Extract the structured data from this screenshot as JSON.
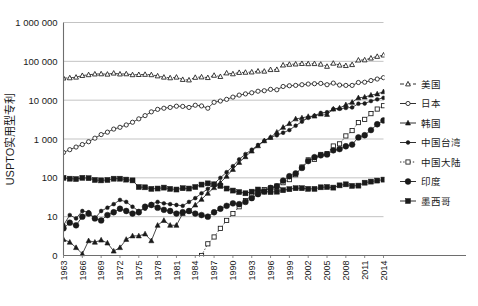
{
  "chart_data": {
    "type": "line",
    "title": "",
    "xlabel": "",
    "ylabel": "USPTO实用型专利",
    "yscale": "log",
    "ylim": [
      1,
      1000000
    ],
    "ytick_labels": [
      "1 000 000",
      "100 000",
      "10 000",
      "1 000",
      "100",
      "10",
      "0"
    ],
    "ytick_values": [
      1000000,
      100000,
      10000,
      1000,
      100,
      10,
      1
    ],
    "grid": true,
    "legend_position": "right",
    "x": [
      1963,
      1964,
      1965,
      1966,
      1967,
      1968,
      1969,
      1970,
      1971,
      1972,
      1973,
      1974,
      1975,
      1976,
      1977,
      1978,
      1979,
      1980,
      1981,
      1982,
      1983,
      1984,
      1985,
      1986,
      1987,
      1988,
      1989,
      1990,
      1991,
      1992,
      1993,
      1994,
      1995,
      1996,
      1997,
      1998,
      1999,
      2000,
      2001,
      2002,
      2003,
      2004,
      2005,
      2006,
      2007,
      2008,
      2009,
      2010,
      2011,
      2012,
      2013,
      2014
    ],
    "xtick_labels": [
      "1963",
      "1966",
      "1969",
      "1972",
      "1975",
      "1978",
      "1981",
      "1984",
      "1987",
      "1990",
      "1993",
      "1996",
      "1999",
      "2002",
      "2005",
      "2008",
      "2011",
      "2014"
    ],
    "series": [
      {
        "name": "美国",
        "marker": "open-triangle",
        "line": "dashed",
        "values": [
          37000,
          37500,
          39000,
          43000,
          45000,
          47000,
          47500,
          46500,
          49500,
          47000,
          47500,
          45000,
          45500,
          46000,
          45000,
          42000,
          39000,
          37500,
          39000,
          34000,
          33000,
          38500,
          39500,
          38000,
          43500,
          40500,
          50000,
          47500,
          51500,
          52000,
          53000,
          56000,
          55500,
          61000,
          61500,
          80000,
          83500,
          85000,
          87500,
          86500,
          87000,
          84000,
          74000,
          89000,
          79500,
          77500,
          82000,
          107500,
          108500,
          121000,
          133500,
          144500
        ]
      },
      {
        "name": "日本",
        "marker": "open-circle",
        "line": "solid",
        "values": [
          450,
          530,
          620,
          720,
          850,
          1050,
          1300,
          1500,
          1800,
          2000,
          2300,
          2700,
          3300,
          4000,
          5000,
          5800,
          6200,
          6500,
          7000,
          6900,
          6500,
          7400,
          7100,
          6200,
          8800,
          9500,
          10500,
          12000,
          13500,
          14500,
          15500,
          17000,
          17500,
          19000,
          18500,
          22500,
          23500,
          24000,
          25000,
          26000,
          26500,
          27000,
          25000,
          27500,
          24500,
          24000,
          24000,
          28500,
          29000,
          32000,
          35000,
          38000
        ]
      },
      {
        "name": "韩国",
        "marker": "filled-triangle",
        "line": "solid",
        "values": [
          2.6,
          2.2,
          1.6,
          1.1,
          2.4,
          2.2,
          2.5,
          2.1,
          1.3,
          1.6,
          2.6,
          3.2,
          3.2,
          3.6,
          2.4,
          6,
          8,
          6,
          6,
          12,
          14,
          20,
          28,
          40,
          56,
          75,
          110,
          165,
          250,
          350,
          490,
          670,
          900,
          1100,
          1500,
          2000,
          2500,
          3300,
          3500,
          3800,
          3900,
          4400,
          4300,
          5900,
          6300,
          7600,
          8800,
          11500,
          12000,
          13500,
          14500,
          16500
        ]
      },
      {
        "name": "中国台湾",
        "marker": "filled-circle-small",
        "line": "solid",
        "values": [
          6,
          11,
          9,
          14,
          13,
          9,
          14,
          17,
          21,
          27,
          24,
          18,
          14,
          16,
          21,
          24,
          22,
          21,
          20,
          19,
          24,
          30,
          40,
          52,
          70,
          100,
          140,
          200,
          300,
          410,
          530,
          700,
          900,
          1100,
          1250,
          1450,
          1700,
          2200,
          2800,
          3500,
          4000,
          4700,
          4900,
          5900,
          6000,
          6300,
          6500,
          8100,
          8200,
          9500,
          10500,
          11500
        ]
      },
      {
        "name": "中国大陆",
        "marker": "open-square",
        "line": "dotted",
        "values": [
          null,
          null,
          null,
          null,
          null,
          null,
          null,
          null,
          null,
          null,
          null,
          null,
          null,
          null,
          null,
          null,
          null,
          null,
          null,
          null,
          null,
          null,
          1,
          2,
          3,
          5,
          8,
          12,
          18,
          26,
          35,
          45,
          50,
          55,
          62,
          75,
          90,
          120,
          190,
          290,
          300,
          400,
          420,
          660,
          750,
          1200,
          1650,
          2650,
          3200,
          4500,
          5900,
          7200
        ]
      },
      {
        "name": "印度",
        "marker": "filled-circle-large",
        "line": "solid",
        "values": [
          5,
          7,
          6,
          10,
          12,
          9,
          8,
          11,
          13,
          16,
          14,
          12,
          13,
          18,
          20,
          17,
          15,
          14,
          12,
          13,
          14,
          12,
          11,
          10,
          13,
          16,
          19,
          22,
          21,
          24,
          30,
          38,
          45,
          55,
          60,
          85,
          110,
          130,
          180,
          270,
          340,
          380,
          400,
          510,
          550,
          650,
          720,
          1100,
          1250,
          1700,
          2400,
          3000
        ]
      },
      {
        "name": "墨西哥",
        "marker": "filled-square",
        "line": "solid",
        "values": [
          100,
          95,
          93,
          100,
          98,
          88,
          86,
          88,
          95,
          95,
          90,
          86,
          58,
          57,
          52,
          53,
          56,
          52,
          50,
          54,
          53,
          58,
          67,
          72,
          68,
          62,
          53,
          47,
          43,
          40,
          44,
          50,
          44,
          43,
          44,
          48,
          51,
          54,
          54,
          52,
          52,
          57,
          58,
          56,
          64,
          68,
          62,
          63,
          75,
          80,
          85,
          90
        ]
      }
    ]
  },
  "legend": {
    "items": [
      {
        "label": "美国"
      },
      {
        "label": "日本"
      },
      {
        "label": "韩国"
      },
      {
        "label": "中国台湾"
      },
      {
        "label": "中国大陆"
      },
      {
        "label": "印度"
      },
      {
        "label": "墨西哥"
      }
    ]
  },
  "colors": {
    "line": "#1a1a1a",
    "grid": "#b4b4b4",
    "axis": "#6e6e6e",
    "background": "#ffffff"
  }
}
